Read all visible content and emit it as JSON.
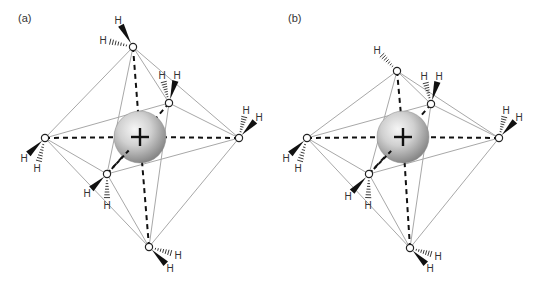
{
  "figure": {
    "panels": [
      {
        "label": "(a)",
        "label_pos": [
          18,
          22
        ],
        "ion": {
          "cx": 140,
          "cy": 137,
          "r": 26,
          "charge": "+"
        },
        "waters": [
          {
            "id": "top",
            "o": [
              133,
              47
            ],
            "h": [
              {
                "pos": [
                  118,
                  20
                ],
                "kind": "wedge",
                "label": "H"
              },
              {
                "pos": [
                  103,
                  40
                ],
                "kind": "hash",
                "label": "H"
              }
            ]
          },
          {
            "id": "upper-right",
            "o": [
              169,
              103
            ],
            "h": [
              {
                "pos": [
                  162,
                  75
                ],
                "kind": "hash",
                "label": "H"
              },
              {
                "pos": [
                  177,
                  75
                ],
                "kind": "wedge",
                "label": "H"
              }
            ]
          },
          {
            "id": "right",
            "o": [
              239,
              138
            ],
            "h": [
              {
                "pos": [
                  246,
                  110
                ],
                "kind": "hash",
                "label": "H"
              },
              {
                "pos": [
                  259,
                  117
                ],
                "kind": "wedge",
                "label": "H"
              }
            ]
          },
          {
            "id": "left",
            "o": [
              45,
              138
            ],
            "h": [
              {
                "pos": [
                  24,
                  158
                ],
                "kind": "wedge",
                "label": "H"
              },
              {
                "pos": [
                  37,
                  168
                ],
                "kind": "hash",
                "label": "H"
              }
            ]
          },
          {
            "id": "lower-left",
            "o": [
              107,
              174
            ],
            "h": [
              {
                "pos": [
                  87,
                  193
                ],
                "kind": "wedge",
                "label": "H"
              },
              {
                "pos": [
                  107,
                  205
                ],
                "kind": "hash",
                "label": "H"
              }
            ]
          },
          {
            "id": "bottom",
            "o": [
              149,
              247
            ],
            "h": [
              {
                "pos": [
                  178,
                  255
                ],
                "kind": "hash",
                "label": "H"
              },
              {
                "pos": [
                  170,
                  268
                ],
                "kind": "wedge",
                "label": "H"
              }
            ]
          }
        ]
      },
      {
        "label": "(b)",
        "label_pos": [
          288,
          22
        ],
        "ion": {
          "cx": 403,
          "cy": 137,
          "r": 26,
          "charge": "+"
        },
        "waters": [
          {
            "id": "top",
            "o": [
              397,
              71
            ],
            "h": [
              {
                "pos": [
                  377,
                  50
                ],
                "kind": "hash",
                "label": "H"
              }
            ]
          },
          {
            "id": "upper-right",
            "o": [
              431,
              104
            ],
            "h": [
              {
                "pos": [
                  424,
                  76
                ],
                "kind": "hash",
                "label": "H"
              },
              {
                "pos": [
                  439,
                  76
                ],
                "kind": "wedge",
                "label": "H"
              }
            ]
          },
          {
            "id": "right",
            "o": [
              499,
              138
            ],
            "h": [
              {
                "pos": [
                  506,
                  110
                ],
                "kind": "hash",
                "label": "H"
              },
              {
                "pos": [
                  519,
                  117
                ],
                "kind": "wedge",
                "label": "H"
              }
            ]
          },
          {
            "id": "left",
            "o": [
              307,
              138
            ],
            "h": [
              {
                "pos": [
                  286,
                  158
                ],
                "kind": "wedge",
                "label": "H"
              },
              {
                "pos": [
                  298,
                  168
                ],
                "kind": "hash",
                "label": "H"
              }
            ]
          },
          {
            "id": "lower-left",
            "o": [
              369,
              174
            ],
            "h": [
              {
                "pos": [
                  348,
                  196
                ],
                "kind": "wedge",
                "label": "H"
              },
              {
                "pos": [
                  368,
                  205
                ],
                "kind": "hash",
                "label": "H"
              }
            ]
          },
          {
            "id": "bottom",
            "o": [
              410,
              248
            ],
            "h": [
              {
                "pos": [
                  438,
                  256
                ],
                "kind": "hash",
                "label": "H"
              },
              {
                "pos": [
                  430,
                  268
                ],
                "kind": "wedge",
                "label": "H"
              }
            ]
          }
        ]
      }
    ],
    "colors": {
      "edge": "#a8a8a8",
      "coordination": "#111111",
      "atom_stroke": "#222222",
      "ion_light": "#f4f4f4",
      "ion_dark": "#8a8a8a"
    }
  }
}
